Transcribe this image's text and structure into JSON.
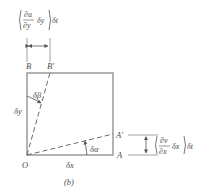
{
  "figure": {
    "caption": "(b)",
    "points": {
      "O": "O",
      "A": "A",
      "A_prime": "A′",
      "B": "B",
      "B_prime": "B′"
    },
    "sides": {
      "dx": "δx",
      "dy": "δy"
    },
    "angles": {
      "alpha": "δα",
      "beta": "δβ"
    },
    "top_annotation": {
      "numerator": "∂u",
      "denominator": "∂y",
      "factor": "δy",
      "time": "δt"
    },
    "right_annotation": {
      "numerator": "∂v",
      "denominator": "∂x",
      "factor": "δx",
      "time": "δt"
    },
    "colors": {
      "line": "#8a8a8a",
      "text": "#4a4a4a",
      "background": "#ffffff"
    }
  }
}
